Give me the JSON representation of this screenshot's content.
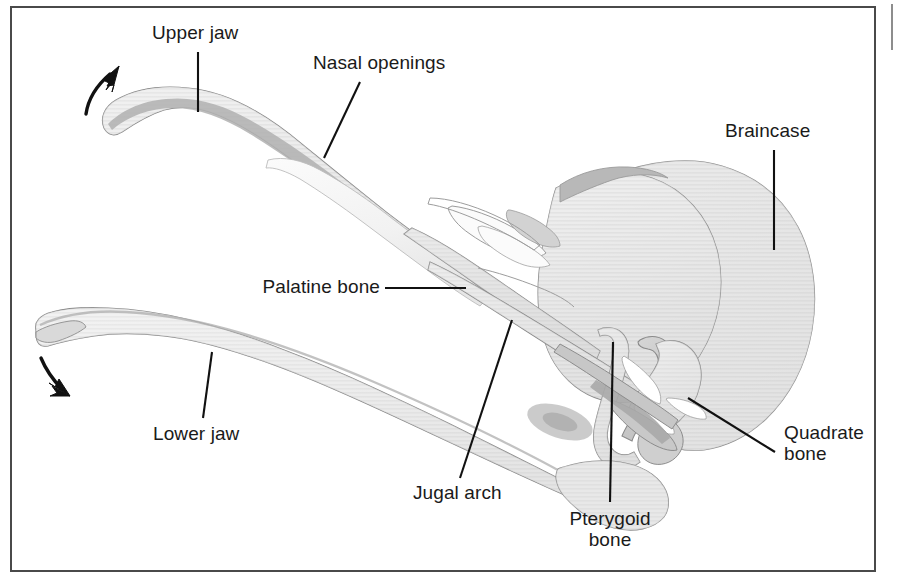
{
  "figure": {
    "kind": "anatomical-diagram",
    "background_color": "#ffffff",
    "frame_color": "#4a4a4a",
    "label_text_color": "#1a1a1a",
    "leader_line_color": "#111111",
    "bone_fill_light": "#e2e2e2",
    "bone_fill_mid": "#cfcfcf",
    "bone_fill_dark": "#bdbdbd",
    "bone_fill_darkest": "#a8a8a8",
    "bone_outline": "#8a8a8a"
  },
  "labels": [
    {
      "id": "upper-jaw",
      "text": "Upper jaw",
      "align": "center",
      "x": 152,
      "y": 22,
      "leader": {
        "type": "line",
        "x1": 198,
        "y1": 52,
        "x2": 198,
        "y2": 112
      }
    },
    {
      "id": "nasal-openings",
      "text": "Nasal openings",
      "align": "center",
      "x": 313,
      "y": 52,
      "leader": {
        "type": "line",
        "x1": 360,
        "y1": 82,
        "x2": 324,
        "y2": 158
      }
    },
    {
      "id": "braincase",
      "text": "Braincase",
      "align": "center",
      "x": 725,
      "y": 120,
      "leader": {
        "type": "line",
        "x1": 774,
        "y1": 150,
        "x2": 774,
        "y2": 250
      }
    },
    {
      "id": "palatine-bone",
      "text": "Palatine bone",
      "align": "right",
      "x": 248,
      "y": 276,
      "leader": {
        "type": "line",
        "x1": 385,
        "y1": 288,
        "x2": 466,
        "y2": 288
      }
    },
    {
      "id": "lower-jaw",
      "text": "Lower jaw",
      "align": "center",
      "x": 153,
      "y": 423,
      "leader": {
        "type": "line",
        "x1": 203,
        "y1": 418,
        "x2": 212,
        "y2": 352
      }
    },
    {
      "id": "jugal-arch",
      "text": "Jugal arch",
      "align": "center",
      "x": 413,
      "y": 482,
      "leader": {
        "type": "line",
        "x1": 460,
        "y1": 478,
        "x2": 512,
        "y2": 320
      }
    },
    {
      "id": "pterygoid-bone",
      "text": "Pterygoid\nbone",
      "align": "center",
      "x": 565,
      "y": 508,
      "leader": {
        "type": "line",
        "x1": 610,
        "y1": 502,
        "x2": 613,
        "y2": 342
      }
    },
    {
      "id": "quadrate-bone",
      "text": "Quadrate\nbone",
      "align": "left",
      "x": 784,
      "y": 432,
      "leader": {
        "type": "line",
        "x1": 775,
        "y1": 452,
        "x2": 688,
        "y2": 398
      }
    }
  ],
  "motion_arrows": [
    {
      "id": "upper-jaw-motion-arrow",
      "direction": "up-right",
      "description": "Curved arrow indicating upper jaw elevation"
    },
    {
      "id": "lower-jaw-motion-arrow",
      "direction": "down-right",
      "description": "Curved arrow indicating lower jaw depression"
    }
  ],
  "bone_regions": [
    {
      "id": "upper-jaw-bone",
      "name": "Upper jaw"
    },
    {
      "id": "nasal-opening-region",
      "name": "Nasal openings"
    },
    {
      "id": "braincase-bone",
      "name": "Braincase"
    },
    {
      "id": "palatine-bone-shape",
      "name": "Palatine bone"
    },
    {
      "id": "lower-jaw-bone",
      "name": "Lower jaw"
    },
    {
      "id": "jugal-arch-bone",
      "name": "Jugal arch"
    },
    {
      "id": "pterygoid-bone-shape",
      "name": "Pterygoid bone"
    },
    {
      "id": "quadrate-bone-shape",
      "name": "Quadrate bone"
    }
  ]
}
